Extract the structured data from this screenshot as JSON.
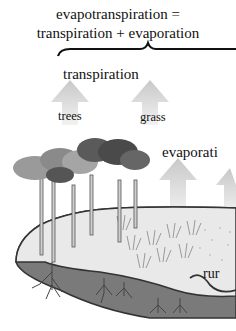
{
  "diagram": {
    "title_line1": "evapotranspiration =",
    "title_line2": "transpiration + evaporation",
    "labels": {
      "transpiration": "transpiration",
      "trees": "trees",
      "grass": "grass",
      "evaporation": "evaporati",
      "runoff": "rur"
    },
    "colors": {
      "soil": "#7a7a7a",
      "surface": "#e9e9e9",
      "arrow": "#d2d2d2",
      "outline": "#333333",
      "tree_dark": "#555555",
      "tree_light": "#9a9a9a"
    }
  }
}
